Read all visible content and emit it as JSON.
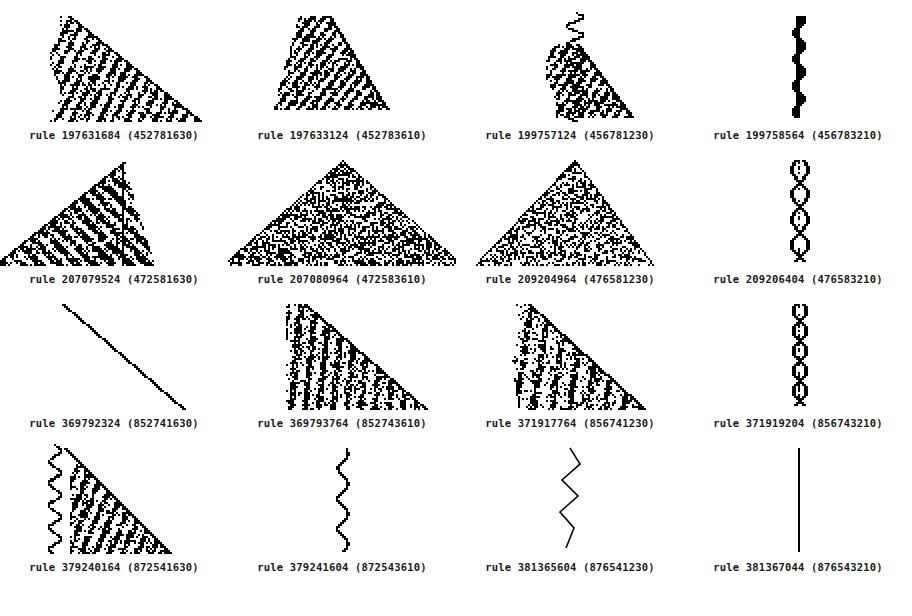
{
  "figure": {
    "type": "cellular-automaton-grid",
    "columns": 4,
    "rows": 4,
    "background_color": "#ffffff",
    "ink_color": "#000000",
    "caption_prefix": "rule"
  },
  "chart_data": {
    "type": "heatmap",
    "title": "",
    "xlabel": "",
    "ylabel": "",
    "panels": [
      {
        "index": 0,
        "row": 0,
        "col": 0,
        "caption": "rule 197631684 (452781630)",
        "rule_number": "197631684",
        "code": "452781630",
        "shape": "right-triangle-textured",
        "seed": 11
      },
      {
        "index": 1,
        "row": 0,
        "col": 1,
        "caption": "rule 197633124 (452783610)",
        "rule_number": "197633124",
        "code": "452783610",
        "shape": "narrow-right-triangle-textured",
        "seed": 27
      },
      {
        "index": 2,
        "row": 0,
        "col": 2,
        "caption": "rule 199757124 (456781230)",
        "rule_number": "199757124",
        "code": "456781230",
        "shape": "wandering-left-edge-triangle",
        "seed": 41
      },
      {
        "index": 3,
        "row": 0,
        "col": 3,
        "caption": "rule 199758564 (456783210)",
        "rule_number": "199758564",
        "code": "456783210",
        "shape": "vertical-zigzag-narrow",
        "seed": 5
      },
      {
        "index": 4,
        "row": 1,
        "col": 0,
        "caption": "rule 207079524 (472581630)",
        "rule_number": "207079524",
        "code": "472581630",
        "shape": "full-triangle-striped",
        "seed": 63
      },
      {
        "index": 5,
        "row": 1,
        "col": 1,
        "caption": "rule 207080964 (472583610)",
        "rule_number": "207080964",
        "code": "472583610",
        "shape": "full-triangle-chaotic",
        "seed": 77
      },
      {
        "index": 6,
        "row": 1,
        "col": 2,
        "caption": "rule 209204964 (476581230)",
        "rule_number": "209204964",
        "code": "476581230",
        "shape": "triangle-chaotic-medium",
        "seed": 88
      },
      {
        "index": 7,
        "row": 1,
        "col": 3,
        "caption": "rule 209206404 (476583210)",
        "rule_number": "209206404",
        "code": "476583210",
        "shape": "vertical-braid-narrow",
        "seed": 19
      },
      {
        "index": 8,
        "row": 2,
        "col": 0,
        "caption": "rule 369792324 (852741630)",
        "rule_number": "369792324",
        "code": "852741630",
        "shape": "single-diagonal-line",
        "seed": 3
      },
      {
        "index": 9,
        "row": 2,
        "col": 1,
        "caption": "rule 369793764 (852743610)",
        "rule_number": "369793764",
        "code": "852743610",
        "shape": "right-triangle-striped",
        "seed": 55
      },
      {
        "index": 10,
        "row": 2,
        "col": 2,
        "caption": "rule 371917764 (856741230)",
        "rule_number": "371917764",
        "code": "856741230",
        "shape": "right-triangle-sparse",
        "seed": 34
      },
      {
        "index": 11,
        "row": 2,
        "col": 3,
        "caption": "rule 371919204 (856743210)",
        "rule_number": "371919204",
        "code": "856743210",
        "shape": "vertical-braid-narrow-2",
        "seed": 23
      },
      {
        "index": 12,
        "row": 3,
        "col": 0,
        "caption": "rule 379240164 (872541630)",
        "rule_number": "379240164",
        "code": "872541630",
        "shape": "triangle-with-wavy-tail",
        "seed": 91
      },
      {
        "index": 13,
        "row": 3,
        "col": 1,
        "caption": "rule 379241604 (872543610)",
        "rule_number": "379241604",
        "code": "872543610",
        "shape": "thin-vertical-wave",
        "seed": 7
      },
      {
        "index": 14,
        "row": 3,
        "col": 2,
        "caption": "rule 381365604 (876541230)",
        "rule_number": "381365604",
        "code": "876541230",
        "shape": "large-vertical-zigzag",
        "seed": 13
      },
      {
        "index": 15,
        "row": 3,
        "col": 3,
        "caption": "rule 381367044 (876543210)",
        "rule_number": "381367044",
        "code": "876543210",
        "shape": "straight-vertical-line",
        "seed": 1
      }
    ]
  }
}
